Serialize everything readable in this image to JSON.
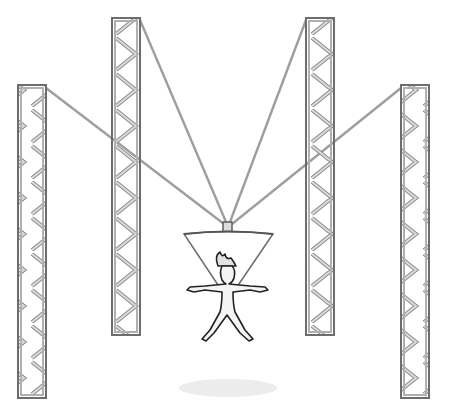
{
  "scene": {
    "title": "",
    "description": "Cable-suspended camera rig with four truss towers over a standing figure",
    "colors": {
      "background": "#ffffff",
      "truss_outline": "#7a7a7a",
      "truss_fill": "#c8c8c8",
      "cable": "#9a9a9a",
      "cone_outline": "#6e6e6e",
      "figure_outline": "#222222",
      "figure_fill": "#f2f2f2",
      "shadow": "#e6e6e6"
    },
    "trusses": [
      {
        "name": "truss-left-outer",
        "x": 18,
        "top": 85,
        "bottom": 398,
        "width": 28
      },
      {
        "name": "truss-left-inner",
        "x": 112,
        "top": 18,
        "bottom": 335,
        "width": 28
      },
      {
        "name": "truss-right-inner",
        "x": 306,
        "top": 18,
        "bottom": 335,
        "width": 28
      },
      {
        "name": "truss-right-outer",
        "x": 401,
        "top": 85,
        "bottom": 398,
        "width": 28
      }
    ],
    "cable_hub": {
      "x": 228,
      "y": 222
    }
  }
}
